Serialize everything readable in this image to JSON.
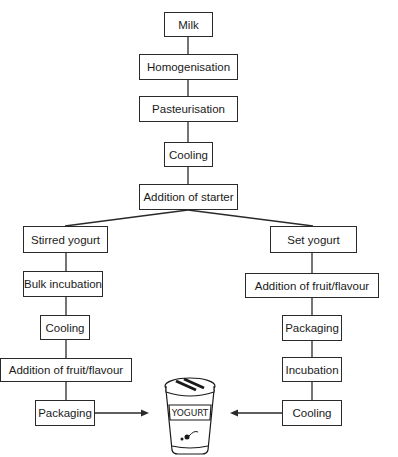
{
  "diagram": {
    "type": "flowchart",
    "root_steps": [
      "Milk",
      "Homogenisation",
      "Pasteurisation",
      "Cooling",
      "Addition of starter"
    ],
    "branches": {
      "stirred": {
        "label": "Stirred yogurt",
        "steps": [
          "Bulk incubation",
          "Cooling",
          "Addition of fruit/flavour",
          "Packaging"
        ]
      },
      "set": {
        "label": "Set yogurt",
        "steps": [
          "Addition of fruit/flavour",
          "Packaging",
          "Incubation",
          "Cooling"
        ]
      }
    },
    "product": {
      "label": "YOGURT",
      "icon": "yogurt-cup-icon"
    },
    "colors": {
      "stroke": "#2a2a2a",
      "background": "#ffffff",
      "text": "#1a1a1a"
    }
  }
}
